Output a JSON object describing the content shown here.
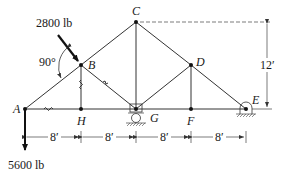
{
  "diagram": {
    "type": "truss",
    "nodes": {
      "A": {
        "label": "A",
        "x": 25,
        "y": 109
      },
      "B": {
        "label": "B",
        "x": 81,
        "y": 65
      },
      "C": {
        "label": "C",
        "x": 136,
        "y": 22
      },
      "D": {
        "label": "D",
        "x": 191,
        "y": 65
      },
      "E": {
        "label": "E",
        "x": 246,
        "y": 109
      },
      "F": {
        "label": "F",
        "x": 191,
        "y": 109
      },
      "G": {
        "label": "G",
        "x": 136,
        "y": 109
      },
      "H": {
        "label": "H",
        "x": 81,
        "y": 109
      }
    },
    "members": [
      "A-B",
      "B-C",
      "C-D",
      "D-E",
      "A-H",
      "H-G",
      "G-F",
      "F-E",
      "B-H",
      "B-G",
      "C-G",
      "D-G",
      "D-F"
    ],
    "loads": {
      "inclined": {
        "label": "2800 lb",
        "node": "B",
        "angle_label": "90°"
      },
      "vertical": {
        "label": "5600 lb",
        "node": "A"
      }
    },
    "supports": {
      "G": "roller",
      "E": "pin"
    },
    "dimensions": {
      "spans": [
        "8′",
        "8′",
        "8′",
        "8′"
      ],
      "height": "12′"
    },
    "colors": {
      "line": "#333333",
      "text": "#1a1a1a",
      "background": "#ffffff"
    }
  }
}
